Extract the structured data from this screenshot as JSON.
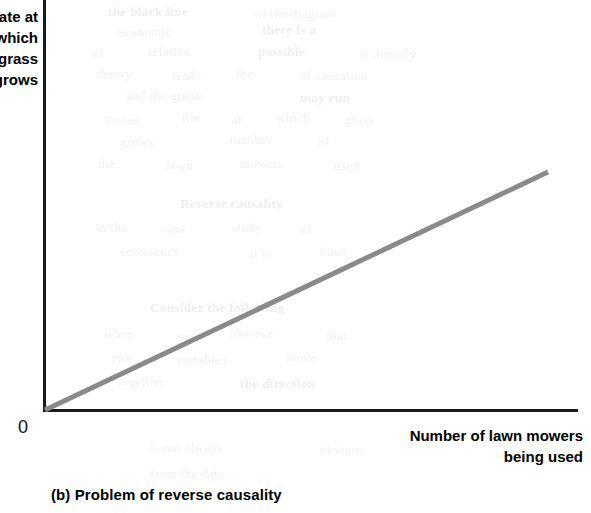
{
  "figure": {
    "caption": "(b) Problem of reverse causality",
    "origin_label": "0",
    "y_axis_label": "Rate at\nwhich\ngrass\ngrows",
    "x_axis_label": "Number of lawn mowers\nbeing used"
  },
  "colors": {
    "axis": "#1a1a1a",
    "trend_line": "#8a8a8a",
    "text": "#000000",
    "background": "#ffffff"
  },
  "ghost_text": [
    {
      "t": "the black line",
      "x": 108,
      "y": 4,
      "b": true
    },
    {
      "t": "of the diagram",
      "x": 255,
      "y": 6,
      "b": false
    },
    {
      "t": "economic",
      "x": 118,
      "y": 24,
      "b": false
    },
    {
      "t": "there is a",
      "x": 262,
      "y": 22,
      "b": true
    },
    {
      "t": "of",
      "x": 92,
      "y": 46,
      "b": false
    },
    {
      "t": "relation",
      "x": 148,
      "y": 44,
      "b": false
    },
    {
      "t": "possible",
      "x": 258,
      "y": 44,
      "b": true
    },
    {
      "t": "is directly",
      "x": 360,
      "y": 46,
      "b": false
    },
    {
      "t": "theory",
      "x": 96,
      "y": 66,
      "b": false
    },
    {
      "t": "tends",
      "x": 172,
      "y": 68,
      "b": false
    },
    {
      "t": "the",
      "x": 236,
      "y": 66,
      "b": false
    },
    {
      "t": "of causation",
      "x": 300,
      "y": 68,
      "b": false
    },
    {
      "t": "and the graph",
      "x": 126,
      "y": 88,
      "b": false
    },
    {
      "t": "may run",
      "x": 300,
      "y": 90,
      "b": true
    },
    {
      "t": "To see",
      "x": 104,
      "y": 112,
      "b": false
    },
    {
      "t": "the",
      "x": 182,
      "y": 110,
      "b": false
    },
    {
      "t": "at",
      "x": 232,
      "y": 112,
      "b": false
    },
    {
      "t": "which",
      "x": 276,
      "y": 110,
      "b": false
    },
    {
      "t": "grass",
      "x": 345,
      "y": 112,
      "b": false
    },
    {
      "t": "grows",
      "x": 120,
      "y": 134,
      "b": false
    },
    {
      "t": "number",
      "x": 230,
      "y": 132,
      "b": false
    },
    {
      "t": "of",
      "x": 318,
      "y": 134,
      "b": false
    },
    {
      "t": "the",
      "x": 98,
      "y": 156,
      "b": false
    },
    {
      "t": "lawn",
      "x": 166,
      "y": 158,
      "b": false
    },
    {
      "t": "mowers",
      "x": 240,
      "y": 156,
      "b": false
    },
    {
      "t": "used",
      "x": 334,
      "y": 158,
      "b": false
    },
    {
      "t": "Reverse causality",
      "x": 180,
      "y": 196,
      "b": true
    },
    {
      "t": "in the",
      "x": 96,
      "y": 220,
      "b": false
    },
    {
      "t": "case",
      "x": 162,
      "y": 222,
      "b": false
    },
    {
      "t": "study",
      "x": 232,
      "y": 220,
      "b": false
    },
    {
      "t": "of",
      "x": 300,
      "y": 222,
      "b": false
    },
    {
      "t": "economics",
      "x": 120,
      "y": 244,
      "b": false
    },
    {
      "t": "it is",
      "x": 250,
      "y": 246,
      "b": false
    },
    {
      "t": "clear",
      "x": 320,
      "y": 244,
      "b": false
    },
    {
      "t": "Consider the following",
      "x": 150,
      "y": 300,
      "b": true
    },
    {
      "t": "when",
      "x": 104,
      "y": 326,
      "b": false
    },
    {
      "t": "we",
      "x": 176,
      "y": 328,
      "b": false
    },
    {
      "t": "observe",
      "x": 230,
      "y": 326,
      "b": false
    },
    {
      "t": "that",
      "x": 326,
      "y": 328,
      "b": false
    },
    {
      "t": "two",
      "x": 112,
      "y": 350,
      "b": false
    },
    {
      "t": "variables",
      "x": 176,
      "y": 352,
      "b": false
    },
    {
      "t": "move",
      "x": 286,
      "y": 350,
      "b": false
    },
    {
      "t": "together",
      "x": 118,
      "y": 374,
      "b": false
    },
    {
      "t": "the direction",
      "x": 240,
      "y": 376,
      "b": true
    },
    {
      "t": "is not always",
      "x": 150,
      "y": 440,
      "b": false
    },
    {
      "t": "obvious",
      "x": 320,
      "y": 442,
      "b": false
    },
    {
      "t": "from the data",
      "x": 150,
      "y": 466,
      "b": false
    }
  ],
  "chart_data": {
    "type": "line",
    "title": "(b) Problem of reverse causality",
    "xlabel": "Number of lawn mowers being used",
    "ylabel": "Rate at which grass grows",
    "grid": false,
    "legend": "none",
    "axis_ticks": {
      "x": [],
      "y": []
    },
    "origin_tick": "0",
    "xlim": [
      0,
      1
    ],
    "ylim": [
      0,
      1
    ],
    "series": [
      {
        "name": "Positive relationship",
        "color": "#8a8a8a",
        "x": [
          0,
          1
        ],
        "y": [
          0,
          1
        ],
        "points_px": [
          [
            45,
            410
          ],
          [
            548,
            172
          ]
        ],
        "description": "Straight upward-sloping line from the origin"
      }
    ]
  }
}
